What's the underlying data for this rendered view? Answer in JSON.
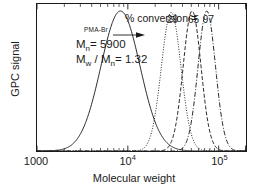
{
  "figure": {
    "background": "#ffffff",
    "line_color": "#1a1a1a"
  },
  "axes": {
    "x": {
      "title": "Molecular weight",
      "scale": "log",
      "min": 1000,
      "max": 200000,
      "tick_labels": [
        {
          "text": "1000",
          "value": 1000,
          "sup": ""
        },
        {
          "text": "10",
          "value": 10000,
          "sup": "4"
        },
        {
          "text": "10",
          "value": 100000,
          "sup": "5"
        }
      ]
    },
    "y": {
      "title": "GPC signal",
      "tick_labels": [],
      "min": 0,
      "max": 1.05
    }
  },
  "annotations": {
    "conversion_header": "% conversion =",
    "macroinitiator_name": "PMA-Br",
    "mn_text": "M",
    "mn_sub": "n",
    "mn_value": "= 5900",
    "mwmn_prefix": "M",
    "mwmn_sub1": "w",
    "mwmn_mid": " / M",
    "mwmn_sub2": "n",
    "mwmn_value": "= 1.32"
  },
  "chart_data": {
    "type": "line",
    "title": "",
    "xlabel": "Molecular weight",
    "ylabel": "GPC signal",
    "xscale": "log",
    "xlim": [
      1000,
      200000
    ],
    "ylim": [
      0,
      1.05
    ],
    "grid": false,
    "legend": "inline-peak-labels",
    "series": [
      {
        "name": "PMA-Br macroinitiator",
        "conversion_label": "",
        "peak_mw": 8300,
        "peak_height": 1.0,
        "sigma_decades": 0.215,
        "tail_skew": 0.33,
        "linestyle": "solid",
        "mn": 5900,
        "mw_over_mn": 1.32
      },
      {
        "name": "29% conversion",
        "conversion_label": "29",
        "peak_mw": 30000,
        "peak_height": 0.99,
        "sigma_decades": 0.108,
        "tail_skew": 0.22,
        "linestyle": "dotted"
      },
      {
        "name": "65% conversion",
        "conversion_label": "65",
        "peak_mw": 51000,
        "peak_height": 1.0,
        "sigma_decades": 0.098,
        "tail_skew": 0.2,
        "linestyle": "dashed"
      },
      {
        "name": "97% conversion",
        "conversion_label": "97",
        "peak_mw": 74000,
        "peak_height": 1.0,
        "sigma_decades": 0.096,
        "tail_skew": 0.19,
        "linestyle": "dashdot"
      }
    ]
  }
}
